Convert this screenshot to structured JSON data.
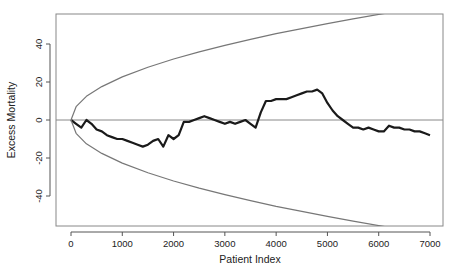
{
  "chart_data": {
    "type": "line",
    "title": "",
    "xlabel": "Patient Index",
    "ylabel": "Excess Mortality",
    "xlim": [
      -300,
      7300
    ],
    "ylim": [
      -57,
      55
    ],
    "xticks": [
      0,
      1000,
      2000,
      3000,
      4000,
      5000,
      6000,
      7000
    ],
    "yticks": [
      -40,
      -20,
      0,
      20,
      40
    ],
    "xtick_labels": [
      "0",
      "1000",
      "2000",
      "3000",
      "4000",
      "5000",
      "6000",
      "7000"
    ],
    "ytick_labels": [
      "-40",
      "-20",
      "0",
      "20",
      "40"
    ],
    "grid": false,
    "reference_line": {
      "y": 0,
      "color": "#888888"
    },
    "series": [
      {
        "name": "Excess Mortality (CUSUM)",
        "color": "#1a1a1a",
        "x": [
          0,
          100,
          200,
          300,
          400,
          500,
          600,
          700,
          800,
          900,
          1000,
          1100,
          1200,
          1300,
          1400,
          1500,
          1600,
          1700,
          1800,
          1900,
          2000,
          2100,
          2200,
          2300,
          2400,
          2500,
          2600,
          2700,
          2800,
          2900,
          3000,
          3100,
          3200,
          3300,
          3400,
          3500,
          3600,
          3700,
          3800,
          3900,
          4000,
          4100,
          4200,
          4300,
          4400,
          4500,
          4600,
          4700,
          4800,
          4900,
          5000,
          5100,
          5200,
          5300,
          5400,
          5500,
          5600,
          5700,
          5800,
          5900,
          6000,
          6100,
          6200,
          6300,
          6400,
          6500,
          6600,
          6700,
          6800,
          6900,
          7000
        ],
        "values": [
          0,
          -2,
          -4,
          0,
          -2,
          -5,
          -6,
          -8,
          -9,
          -10,
          -10,
          -11,
          -12,
          -13,
          -14,
          -13,
          -11,
          -10,
          -14,
          -8,
          -10,
          -8,
          -1,
          -1,
          0,
          1,
          2,
          1,
          0,
          -1,
          -2,
          -1,
          -2,
          -1,
          0,
          -2,
          -4,
          4,
          10,
          10,
          11,
          11,
          11,
          12,
          13,
          14,
          15,
          15,
          16,
          14,
          9,
          5,
          2,
          0,
          -2,
          -4,
          -4,
          -5,
          -4,
          -5,
          -6,
          -6,
          -3,
          -4,
          -4,
          -5,
          -5,
          -6,
          -6,
          -7,
          -8
        ]
      },
      {
        "name": "Upper boundary",
        "color": "#777777",
        "x": [
          0,
          100,
          300,
          600,
          1000,
          1500,
          2000,
          2500,
          3000,
          3500,
          4000,
          4500,
          5000,
          5500,
          6000,
          6200
        ],
        "values": [
          0,
          7,
          12.5,
          17.6,
          22.7,
          27.8,
          32.1,
          35.9,
          39.3,
          42.4,
          45.4,
          48.1,
          50.7,
          53.2,
          55.6,
          56.5
        ]
      },
      {
        "name": "Lower boundary",
        "color": "#777777",
        "x": [
          0,
          100,
          300,
          600,
          1000,
          1500,
          2000,
          2500,
          3000,
          3500,
          4000,
          4500,
          5000,
          5500,
          6000,
          6200
        ],
        "values": [
          0,
          -7,
          -12.5,
          -17.6,
          -22.7,
          -27.8,
          -32.1,
          -35.9,
          -39.3,
          -42.4,
          -45.4,
          -48.1,
          -50.7,
          -53.2,
          -55.6,
          -56.5
        ]
      }
    ]
  }
}
